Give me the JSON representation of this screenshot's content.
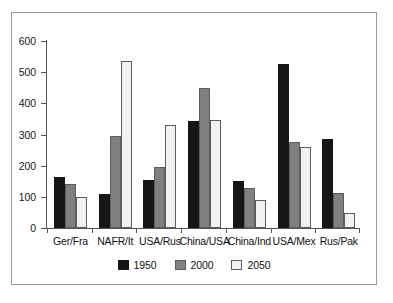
{
  "chart_data": {
    "type": "bar",
    "title": "",
    "xlabel": "",
    "ylabel": "",
    "ylim": [
      0,
      600
    ],
    "yticks": [
      0,
      100,
      200,
      300,
      400,
      500,
      600
    ],
    "grid": false,
    "legend_position": "bottom",
    "categories": [
      "Ger/Fra",
      "NAFR/It",
      "USA/Rus",
      "China/USA",
      "China/Ind",
      "USA/Mex",
      "Rus/Pak"
    ],
    "series": [
      {
        "name": "1950",
        "color": "#161616",
        "values": [
          165,
          110,
          155,
          343,
          150,
          526,
          285
        ]
      },
      {
        "name": "2000",
        "color": "#808080",
        "values": [
          140,
          295,
          195,
          450,
          127,
          275,
          113
        ]
      },
      {
        "name": "2050",
        "color": "#f2f2f2",
        "values": [
          100,
          536,
          332,
          348,
          90,
          260,
          47
        ]
      }
    ]
  },
  "legend": {
    "items": [
      {
        "label": "1950"
      },
      {
        "label": "2000"
      },
      {
        "label": "2050"
      }
    ]
  }
}
